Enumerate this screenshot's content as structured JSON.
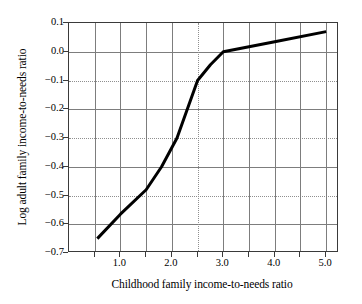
{
  "chart_data": {
    "type": "line",
    "title": "",
    "xlabel": "Childhood family income-to-needs ratio",
    "ylabel": "Log adult family income-to-needs ratio",
    "xlim": [
      0.0,
      5.25
    ],
    "ylim": [
      -0.7,
      0.1
    ],
    "grid": true,
    "legend": null,
    "x_major_ticks": [
      1.0,
      2.0,
      3.0,
      4.0,
      5.0
    ],
    "x_minor_ticks": [
      0.5,
      1.5,
      2.5,
      3.5,
      4.5
    ],
    "x_tick_labels": [
      "1.0",
      "2.0",
      "3.0",
      "4.0",
      "5.0"
    ],
    "y_major_ticks": [
      0.1,
      0.0,
      -0.1,
      -0.2,
      -0.3,
      -0.4,
      -0.5,
      -0.6,
      -0.7
    ],
    "y_tick_labels": [
      "0.1",
      "0.0",
      "−0.1",
      "−0.2",
      "−0.3",
      "−0.4",
      "−0.5",
      "−0.6",
      "−0.7"
    ],
    "series": [
      {
        "name": "spline fit",
        "color": "#000000",
        "line_width": 3,
        "x": [
          0.55,
          1.0,
          1.5,
          1.8,
          2.1,
          2.5,
          2.75,
          3.0,
          4.0,
          5.0
        ],
        "y": [
          -0.65,
          -0.565,
          -0.48,
          -0.4,
          -0.3,
          -0.1,
          -0.045,
          0.0,
          0.035,
          0.07
        ]
      }
    ]
  },
  "axes": {
    "y_ticks": [
      {
        "label": "0.1",
        "value": 0.1
      },
      {
        "label": "0.0",
        "value": 0.0
      },
      {
        "label": "−0.1",
        "value": -0.1
      },
      {
        "label": "−0.2",
        "value": -0.2
      },
      {
        "label": "−0.3",
        "value": -0.3
      },
      {
        "label": "−0.4",
        "value": -0.4
      },
      {
        "label": "−0.5",
        "value": -0.5
      },
      {
        "label": "−0.6",
        "value": -0.6
      },
      {
        "label": "−0.7",
        "value": -0.7
      }
    ],
    "x_ticks": [
      {
        "label": "1.0",
        "value": 1.0
      },
      {
        "label": "2.0",
        "value": 2.0
      },
      {
        "label": "3.0",
        "value": 3.0
      },
      {
        "label": "4.0",
        "value": 4.0
      },
      {
        "label": "5.0",
        "value": 5.0
      }
    ],
    "xlabel": "Childhood family income-to-needs ratio",
    "ylabel": "Log adult family income-to-needs ratio"
  },
  "style": {
    "frame_color": "#3a3a3a",
    "grid_solid_color": "#7d7d7d",
    "grid_dotted_color": "#8f8f8f",
    "line_color": "#000000",
    "background": "#ffffff"
  }
}
